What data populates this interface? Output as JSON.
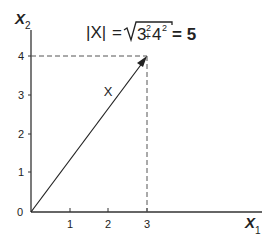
{
  "diagram": {
    "title_formula": {
      "lhs": "|X|",
      "equals": "=",
      "sqrt_content_base1": "3",
      "sqrt_content_exp1": "2",
      "plus": "+",
      "sqrt_content_base2": "4",
      "sqrt_content_exp2": "2",
      "rhs": "= 5"
    },
    "vector_label": "X",
    "x_axis": {
      "name": "X",
      "subscript": "1",
      "ticks": [
        "1",
        "2",
        "3"
      ]
    },
    "y_axis": {
      "name": "X",
      "subscript": "2",
      "ticks": [
        "1",
        "2",
        "3",
        "4"
      ]
    },
    "origin_label": "0",
    "vector": {
      "from": [
        0,
        0
      ],
      "to": [
        3,
        4
      ]
    },
    "colors": {
      "ink": "#222222",
      "dashed": "#555555"
    }
  }
}
